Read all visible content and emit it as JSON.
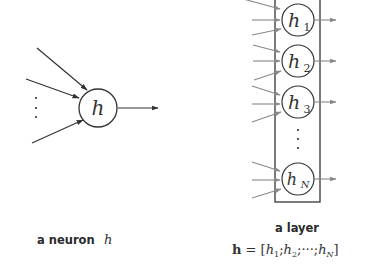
{
  "neuron": {
    "label": "h",
    "caption_text": "a neuron",
    "caption_var": "h",
    "inputs": 3,
    "has_ellipsis": true,
    "outputs": 1
  },
  "layer": {
    "caption": "a layer",
    "formula": {
      "lhs": "h",
      "eq": " = [",
      "parts": [
        "h",
        "1",
        ";",
        "h",
        "2",
        ";",
        "···",
        ";",
        "h",
        "N",
        "]"
      ]
    },
    "neurons": [
      {
        "label": "h",
        "sub": "1"
      },
      {
        "label": "h",
        "sub": "2"
      },
      {
        "label": "h",
        "sub": "3"
      },
      {
        "label": "h",
        "sub": "N"
      }
    ],
    "has_ellipsis": true
  },
  "colors": {
    "stroke_dark": "#333333",
    "stroke_gray": "#8a8a8a",
    "box": "#444444",
    "background": "#ffffff"
  }
}
